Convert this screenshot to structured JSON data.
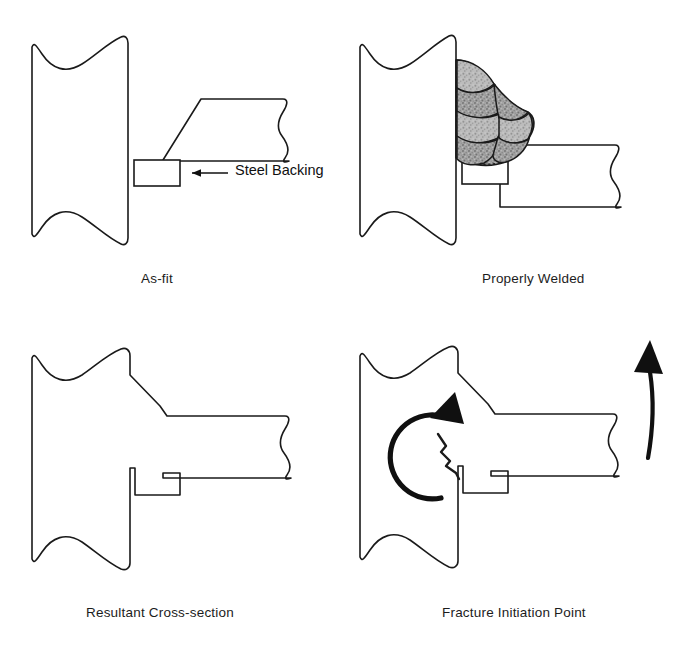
{
  "figure": {
    "type": "engineering-line-diagram",
    "background_color": "#ffffff",
    "line_color": "#1a1a1a",
    "weld_fill_color": "#9a9a9a",
    "weld_fill_color_light": "#b5b5b5",
    "panels": [
      {
        "id": "as-fit",
        "caption": "As-fit",
        "position": "top-left",
        "description": "Column with beam flange fitted against it, steel backing bar beneath the bevelled groove"
      },
      {
        "id": "properly-welded",
        "caption": "Properly Welded",
        "position": "top-right",
        "description": "Same joint with multi-pass weld bead filling the groove above the backing bar"
      },
      {
        "id": "resultant-cross-section",
        "caption": "Resultant Cross-section",
        "position": "bottom-left",
        "description": "Outline of the completed joint showing the weld profile merged into column and beam, with backing bar notch"
      },
      {
        "id": "fracture-initiation-point",
        "caption": "Fracture Initiation Point",
        "position": "bottom-right",
        "description": "Same cross-section with a crack running from the backing bar notch, a rotation arrow at the column and an upward arrow at the beam end"
      }
    ],
    "annotations": [
      {
        "id": "steel-backing",
        "label": "Steel Backing",
        "leader": "arrow pointing left to the backing bar",
        "panel": "as-fit"
      },
      {
        "id": "rotation-arrow",
        "label": "",
        "icon": "circular-rotation-arrow",
        "panel": "fracture-initiation-point"
      },
      {
        "id": "uplift-arrow",
        "label": "",
        "icon": "curved-up-arrow",
        "panel": "fracture-initiation-point"
      },
      {
        "id": "crack",
        "label": "",
        "icon": "jagged-crack-line",
        "panel": "fracture-initiation-point"
      }
    ]
  }
}
